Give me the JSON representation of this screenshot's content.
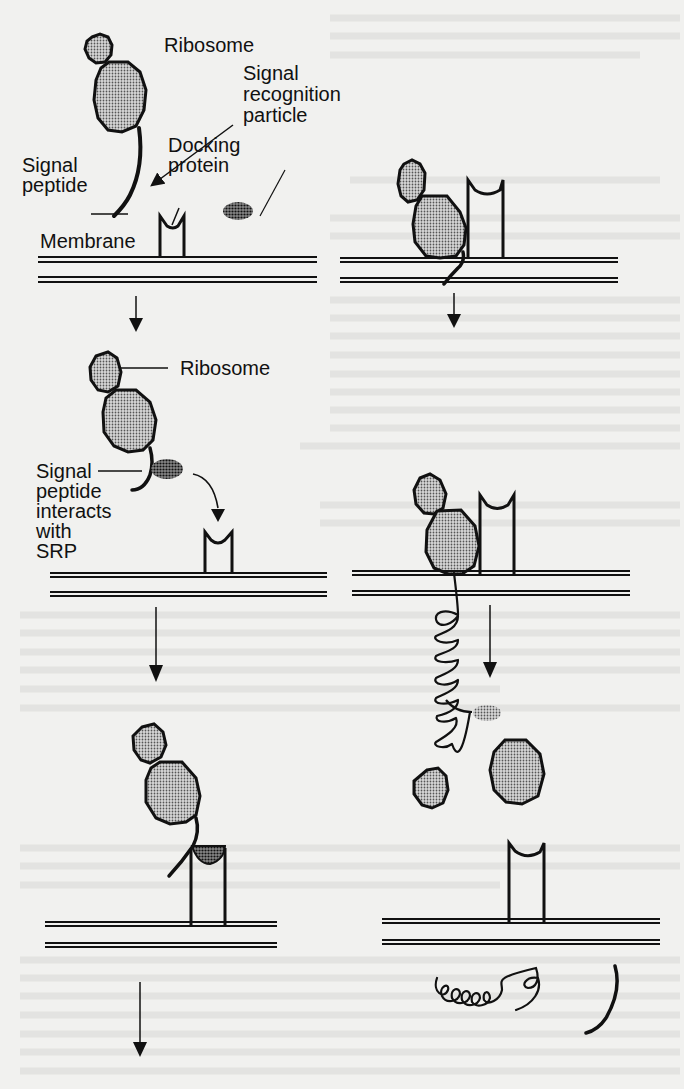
{
  "figure": {
    "colors": {
      "paper": "#f1f1ef",
      "ink": "#111111",
      "ribosome_fill": "#a9a9a9",
      "srp_fill": "#555555"
    },
    "labels": {
      "ribosome": "Ribosome",
      "srp_line1": "Signal",
      "srp_line2": "recognition",
      "srp_line3": "particle",
      "docking_line1": "Docking",
      "docking_line2": "protein",
      "signal_peptide_line1": "Signal",
      "signal_peptide_line2": "peptide",
      "membrane": "Membrane",
      "ribosome_2": "Ribosome",
      "interacts_line1": "Signal",
      "interacts_line2": "peptide",
      "interacts_line3": "interacts",
      "interacts_line4": "with",
      "interacts_line5": "SRP"
    },
    "panels": [
      {
        "id": "1a",
        "row": 1,
        "col": "left",
        "state": "Free ribosome with signal peptide, free SRP, docking protein in membrane"
      },
      {
        "id": "1b",
        "row": 1,
        "col": "right",
        "state": "Ribosome docked at membrane, peptide inserted"
      },
      {
        "id": "2a",
        "row": 2,
        "col": "left",
        "state": "SRP binds signal peptide and moves toward docking protein"
      },
      {
        "id": "2b",
        "row": 2,
        "col": "right",
        "state": "Growing polypeptide coils through membrane; signal peptide cleaved"
      },
      {
        "id": "3a",
        "row": 3,
        "col": "left",
        "state": "SRP binds docking protein; ribosome attached"
      },
      {
        "id": "3b",
        "row": 3,
        "col": "right",
        "state": "Ribosome subunits released; completed protein below membrane"
      }
    ]
  }
}
